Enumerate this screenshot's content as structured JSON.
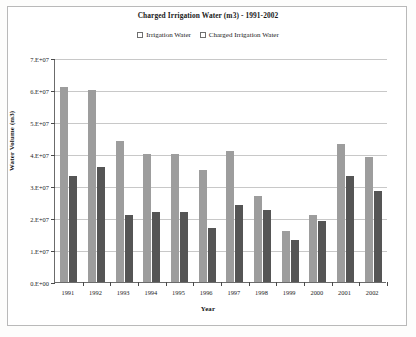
{
  "chart_data": {
    "type": "bar",
    "title": "Charged Irrigation Water (m3) - 1991-2002",
    "xlabel": "Year",
    "ylabel": "Water Volume (m3)",
    "categories": [
      "1991",
      "1992",
      "1993",
      "1994",
      "1995",
      "1996",
      "1997",
      "1998",
      "1999",
      "2000",
      "2001",
      "2002"
    ],
    "series": [
      {
        "name": "Irrigation Water",
        "color": "#9d9d9d",
        "values": [
          61000000,
          60000000,
          44000000,
          40000000,
          40000000,
          35000000,
          41000000,
          27000000,
          16000000,
          21000000,
          43000000,
          39000000
        ]
      },
      {
        "name": "Charged Irrigation Water",
        "color": "#555555",
        "values": [
          33000000,
          36000000,
          21000000,
          22000000,
          22000000,
          17000000,
          24000000,
          22500000,
          13000000,
          19000000,
          33000000,
          28500000
        ]
      }
    ],
    "ylim": [
      0,
      70000000
    ],
    "ytick_values": [
      0,
      10000000,
      20000000,
      30000000,
      40000000,
      50000000,
      60000000,
      70000000
    ],
    "ytick_labels": [
      "0.E+00",
      "1.E+07",
      "2.E+07",
      "3.E+07",
      "4.E+07",
      "5.E+07",
      "6.E+07",
      "7.E+07"
    ],
    "grid": true,
    "legend_position": "top"
  }
}
